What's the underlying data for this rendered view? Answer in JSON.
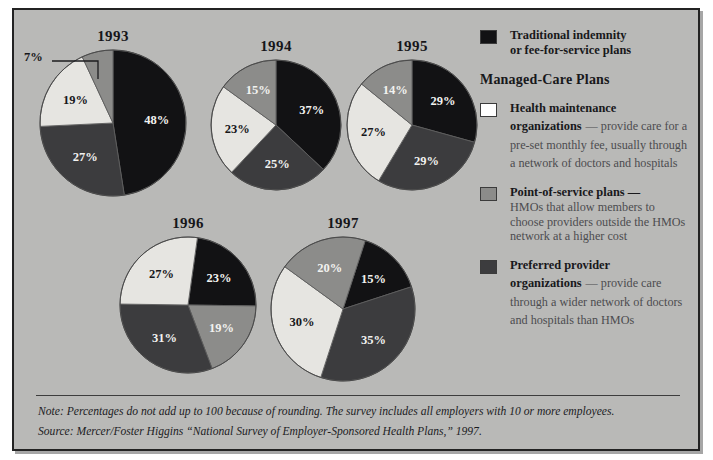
{
  "chart_data": {
    "type": "pie",
    "title": "",
    "legend_position": "right",
    "note": "Percentages do not add up to 100 because of rounding.",
    "categories": [
      "Traditional indemnity or fee-for-service plans",
      "Point-of-service plans",
      "Health maintenance organizations",
      "Preferred provider organizations"
    ],
    "charts": [
      {
        "title": "1993",
        "slices": [
          {
            "label": "48%",
            "value": 48,
            "category": "Traditional indemnity or fee-for-service plans",
            "color": "#121214"
          },
          {
            "label": "27%",
            "value": 27,
            "category": "Preferred provider organizations",
            "color": "#3c3c3e"
          },
          {
            "label": "19%",
            "value": 19,
            "category": "Health maintenance organizations",
            "color": "#e6e5e1"
          },
          {
            "label": "7%",
            "value": 7,
            "category": "Point-of-service plans",
            "color": "#8c8c8a"
          }
        ]
      },
      {
        "title": "1994",
        "slices": [
          {
            "label": "37%",
            "value": 37,
            "category": "Traditional indemnity or fee-for-service plans",
            "color": "#121214"
          },
          {
            "label": "25%",
            "value": 25,
            "category": "Preferred provider organizations",
            "color": "#3c3c3e"
          },
          {
            "label": "23%",
            "value": 23,
            "category": "Health maintenance organizations",
            "color": "#e6e5e1"
          },
          {
            "label": "15%",
            "value": 15,
            "category": "Point-of-service plans",
            "color": "#8c8c8a"
          }
        ]
      },
      {
        "title": "1995",
        "slices": [
          {
            "label": "29%",
            "value": 29,
            "category": "Traditional indemnity or fee-for-service plans",
            "color": "#121214"
          },
          {
            "label": "29%",
            "value": 29,
            "category": "Preferred provider organizations",
            "color": "#3c3c3e"
          },
          {
            "label": "27%",
            "value": 27,
            "category": "Health maintenance organizations",
            "color": "#e6e5e1"
          },
          {
            "label": "14%",
            "value": 14,
            "category": "Point-of-service plans",
            "color": "#8c8c8a"
          }
        ]
      },
      {
        "title": "1996",
        "slices": [
          {
            "label": "23%",
            "value": 23,
            "category": "Traditional indemnity or fee-for-service plans",
            "color": "#121214"
          },
          {
            "label": "19%",
            "value": 19,
            "category": "Point-of-service plans",
            "color": "#8c8c8a"
          },
          {
            "label": "31%",
            "value": 31,
            "category": "Preferred provider organizations",
            "color": "#3c3c3e"
          },
          {
            "label": "27%",
            "value": 27,
            "category": "Health maintenance organizations",
            "color": "#e6e5e1"
          }
        ]
      },
      {
        "title": "1997",
        "slices": [
          {
            "label": "15%",
            "value": 15,
            "category": "Traditional indemnity or fee-for-service plans",
            "color": "#121214"
          },
          {
            "label": "35%",
            "value": 35,
            "category": "Preferred provider organizations",
            "color": "#3c3c3e"
          },
          {
            "label": "30%",
            "value": 30,
            "category": "Health maintenance organizations",
            "color": "#e6e5e1"
          },
          {
            "label": "20%",
            "value": 20,
            "category": "Point-of-service plans",
            "color": "#8c8c8a"
          }
        ]
      }
    ]
  },
  "titles": {
    "y1993": "1993",
    "y1994": "1994",
    "y1995": "1995",
    "y1996": "1996",
    "y1997": "1997"
  },
  "callouts": {
    "y1993_small": "7%"
  },
  "legend": {
    "section_label": "Managed-Care Plans",
    "items": [
      {
        "color": "#121214",
        "head": "Traditional indemnity",
        "head2": "or fee-for-service plans",
        "body": ""
      },
      {
        "color": "#ffffff",
        "head": "Health maintenance",
        "head2": "organizations",
        "body": "— provide care for a pre-set monthly fee, usually through a network of doctors and hospitals"
      },
      {
        "color": "#8c8c8a",
        "head": "Point-of-service plans —",
        "head2": "",
        "body": "HMOs that allow members to choose providers outside the HMOs network at a higher cost"
      },
      {
        "color": "#3c3c3e",
        "head": "Preferred provider",
        "head2": "organizations",
        "body": "— provide care through a wider network of doctors and hospitals than HMOs"
      }
    ]
  },
  "footnotes": {
    "note": "Note: Percentages do not add up to 100 because of rounding. The survey includes all employers with 10 or more employees.",
    "source": "Source: Mercer/Foster Higgins “National Survey of Employer-Sponsored Health Plans,” 1997."
  }
}
